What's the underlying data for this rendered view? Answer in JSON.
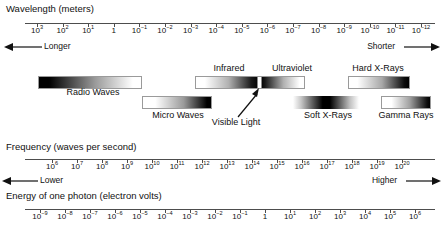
{
  "chart_data": {
    "type": "table",
    "axes": [
      {
        "id": "wavelength",
        "label": "Wavelength (meters)",
        "tick_labels": [
          "10^3",
          "10^2",
          "10^1",
          "1",
          "10^-1",
          "10^-2",
          "10^-3",
          "10^-4",
          "10^-5",
          "10^-6",
          "10^-7",
          "10^-8",
          "10^-9",
          "10^-10",
          "10^-11",
          "10^-12"
        ],
        "exponents": [
          3,
          2,
          1,
          0,
          -1,
          -2,
          -3,
          -4,
          -5,
          -6,
          -7,
          -8,
          -9,
          -10,
          -11,
          -12
        ],
        "left_direction": "Longer",
        "right_direction": "Shorter"
      },
      {
        "id": "frequency",
        "label": "Frequency (waves per second)",
        "tick_labels": [
          "10^6",
          "10^7",
          "10^8",
          "10^9",
          "10^10",
          "10^11",
          "10^12",
          "10^13",
          "10^14",
          "10^15",
          "10^16",
          "10^17",
          "10^18",
          "10^19",
          "10^20"
        ],
        "exponents": [
          6,
          7,
          8,
          9,
          10,
          11,
          12,
          13,
          14,
          15,
          16,
          17,
          18,
          19,
          20
        ],
        "left_direction": "Lower",
        "right_direction": "Higher"
      },
      {
        "id": "energy",
        "label": "Energy of one photon (electron volts)",
        "tick_labels": [
          "10^-9",
          "10^-8",
          "10^-7",
          "10^-6",
          "10^-5",
          "10^-4",
          "10^-3",
          "10^-2",
          "10^-1",
          "1",
          "10^1",
          "10^2",
          "10^3",
          "10^4",
          "10^5",
          "10^6"
        ],
        "exponents": [
          -9,
          -8,
          -7,
          -6,
          -5,
          -4,
          -3,
          -2,
          -1,
          0,
          1,
          2,
          3,
          4,
          5,
          6
        ]
      }
    ],
    "bands": [
      {
        "name": "Radio Waves",
        "label_row": "lower",
        "gradient": "dark-to-light"
      },
      {
        "name": "Micro Waves",
        "label_row": "lower",
        "gradient": "light-to-dark"
      },
      {
        "name": "Infrared",
        "label_row": "upper",
        "gradient": "light-to-dark"
      },
      {
        "name": "Ultraviolet",
        "label_row": "upper",
        "gradient": "dark-to-light"
      },
      {
        "name": "Soft X-Rays",
        "label_row": "lower",
        "gradient": "light-dark-light"
      },
      {
        "name": "Hard X-Rays",
        "label_row": "upper",
        "gradient": "light-to-dark"
      },
      {
        "name": "Gamma Rays",
        "label_row": "lower",
        "gradient": "light-to-dark"
      }
    ],
    "annotations": [
      {
        "name": "Visible Light",
        "points_to": "white notch between Infrared and Ultraviolet"
      }
    ],
    "grid": false,
    "legend": "none"
  },
  "wavelength_axis": {
    "heading": "Wavelength (meters)",
    "ticks": [
      {
        "mantissa": "10",
        "exp": "3"
      },
      {
        "mantissa": "10",
        "exp": "2"
      },
      {
        "mantissa": "10",
        "exp": "1"
      },
      {
        "mantissa": "1",
        "exp": ""
      },
      {
        "mantissa": "10",
        "exp": "-1"
      },
      {
        "mantissa": "10",
        "exp": "-2"
      },
      {
        "mantissa": "10",
        "exp": "-3"
      },
      {
        "mantissa": "10",
        "exp": "-4"
      },
      {
        "mantissa": "10",
        "exp": "-5"
      },
      {
        "mantissa": "10",
        "exp": "-6"
      },
      {
        "mantissa": "10",
        "exp": "-7"
      },
      {
        "mantissa": "10",
        "exp": "-8"
      },
      {
        "mantissa": "10",
        "exp": "-9"
      },
      {
        "mantissa": "10",
        "exp": "-10"
      },
      {
        "mantissa": "10",
        "exp": "-11"
      },
      {
        "mantissa": "10",
        "exp": "-12"
      }
    ],
    "left_label": "Longer",
    "right_label": "Shorter"
  },
  "frequency_axis": {
    "heading": "Frequency (waves per second)",
    "ticks": [
      {
        "mantissa": "10",
        "exp": "6"
      },
      {
        "mantissa": "10",
        "exp": "7"
      },
      {
        "mantissa": "10",
        "exp": "8"
      },
      {
        "mantissa": "10",
        "exp": "9"
      },
      {
        "mantissa": "10",
        "exp": "10"
      },
      {
        "mantissa": "10",
        "exp": "11"
      },
      {
        "mantissa": "10",
        "exp": "12"
      },
      {
        "mantissa": "10",
        "exp": "13"
      },
      {
        "mantissa": "10",
        "exp": "14"
      },
      {
        "mantissa": "10",
        "exp": "15"
      },
      {
        "mantissa": "10",
        "exp": "16"
      },
      {
        "mantissa": "10",
        "exp": "17"
      },
      {
        "mantissa": "10",
        "exp": "18"
      },
      {
        "mantissa": "10",
        "exp": "19"
      },
      {
        "mantissa": "10",
        "exp": "20"
      }
    ],
    "left_label": "Lower",
    "right_label": "Higher"
  },
  "energy_axis": {
    "heading": "Energy of one photon (electron volts)",
    "ticks": [
      {
        "mantissa": "10",
        "exp": "-9"
      },
      {
        "mantissa": "10",
        "exp": "-8"
      },
      {
        "mantissa": "10",
        "exp": "-7"
      },
      {
        "mantissa": "10",
        "exp": "-6"
      },
      {
        "mantissa": "10",
        "exp": "-5"
      },
      {
        "mantissa": "10",
        "exp": "-4"
      },
      {
        "mantissa": "10",
        "exp": "-3"
      },
      {
        "mantissa": "10",
        "exp": "-2"
      },
      {
        "mantissa": "10",
        "exp": "-1"
      },
      {
        "mantissa": "1",
        "exp": ""
      },
      {
        "mantissa": "10",
        "exp": "1"
      },
      {
        "mantissa": "10",
        "exp": "2"
      },
      {
        "mantissa": "10",
        "exp": "3"
      },
      {
        "mantissa": "10",
        "exp": "4"
      },
      {
        "mantissa": "10",
        "exp": "5"
      },
      {
        "mantissa": "10",
        "exp": "6"
      }
    ]
  },
  "bands": {
    "radio": "Radio Waves",
    "micro": "Micro Waves",
    "infrared": "Infrared",
    "ultraviolet": "Ultraviolet",
    "visible": "Visible Light",
    "soft_xrays": "Soft X-Rays",
    "hard_xrays": "Hard X-Rays",
    "gamma": "Gamma Rays"
  },
  "colors": {
    "ink": "#111111",
    "rule": "#4d4d4d",
    "band_dark": "#000000",
    "band_light": "#ffffff",
    "band_border": "#9a9a9a"
  }
}
